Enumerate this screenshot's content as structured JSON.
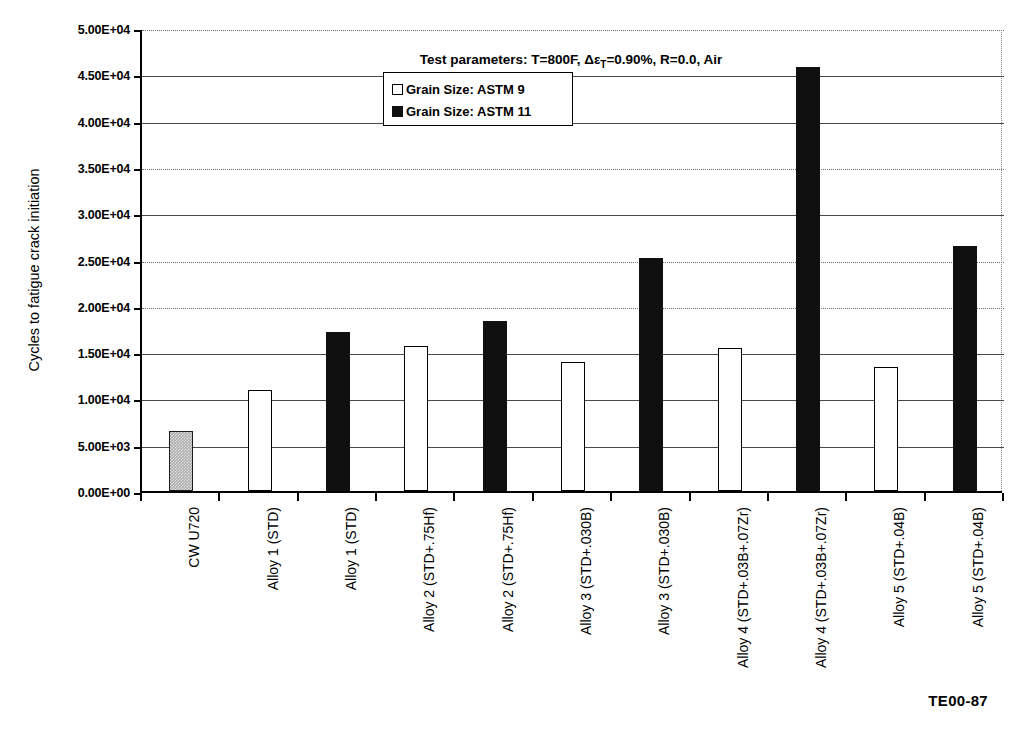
{
  "figure": {
    "footer_code": "TE00-87",
    "title_prefix": "Test parameters: T=800F, ",
    "title_delta": "Δε",
    "title_sub": "T",
    "title_suffix": "=0.90%, R=0.0, Air",
    "title_full": "Test parameters: T=800F, ΔεT=0.90%, R=0.0, Air"
  },
  "legend": {
    "position": "inside-top-center",
    "entries": [
      {
        "label": "Grain Size: ASTM 9",
        "marker": "open-square",
        "color": "#ffffff"
      },
      {
        "label": "Grain Size: ASTM 11",
        "marker": "filled-square",
        "color": "#101010"
      }
    ]
  },
  "axis": {
    "y_title": "Cycles to fatigue crack initiation",
    "y_ticks": [
      "0.00E+00",
      "5.00E+03",
      "1.00E+04",
      "1.50E+04",
      "2.00E+04",
      "2.50E+04",
      "3.00E+04",
      "3.50E+04",
      "4.00E+04",
      "4.50E+04",
      "5.00E+04"
    ],
    "y_tick_values": [
      0,
      5000,
      10000,
      15000,
      20000,
      25000,
      30000,
      35000,
      40000,
      45000,
      50000
    ],
    "x_title": ""
  },
  "chart_data": {
    "type": "bar",
    "title": "Test parameters: T=800F, ΔεT=0.90%, R=0.0, Air",
    "xlabel": "",
    "ylabel": "Cycles to fatigue crack initiation",
    "ylim": [
      0,
      50000
    ],
    "grid": true,
    "legend_position": "inside-top-center",
    "categories": [
      "CW U720",
      "Alloy 1 (STD)",
      "Alloy 1 (STD)",
      "Alloy 2 (STD+.75Hf)",
      "Alloy 2 (STD+.75Hf)",
      "Alloy 3 (STD+.030B)",
      "Alloy 3 (STD+.030B)",
      "Alloy 4 (STD+.03B+.07Zr)",
      "Alloy 4 (STD+.03B+.07Zr)",
      "Alloy 5 (STD+.04B)",
      "Alloy 5 (STD+.04B)"
    ],
    "series_of_bar": [
      "CW U720",
      "Grain Size: ASTM 9",
      "Grain Size: ASTM 11",
      "Grain Size: ASTM 9",
      "Grain Size: ASTM 11",
      "Grain Size: ASTM 9",
      "Grain Size: ASTM 11",
      "Grain Size: ASTM 9",
      "Grain Size: ASTM 11",
      "Grain Size: ASTM 9",
      "Grain Size: ASTM 11"
    ],
    "values": [
      6500,
      10900,
      17200,
      15700,
      18400,
      13900,
      25200,
      15400,
      45800,
      13400,
      26500
    ],
    "series": [
      {
        "name": "Grain Size: ASTM 9",
        "values": [
          null,
          10900,
          null,
          15700,
          null,
          13900,
          null,
          15400,
          null,
          13400,
          null
        ]
      },
      {
        "name": "Grain Size: ASTM 11",
        "values": [
          null,
          null,
          17200,
          null,
          18400,
          null,
          25200,
          null,
          45800,
          null,
          26500
        ]
      },
      {
        "name": "CW U720 (baseline)",
        "values": [
          6500,
          null,
          null,
          null,
          null,
          null,
          null,
          null,
          null,
          null,
          null
        ]
      }
    ]
  },
  "bars": [
    {
      "label": "CW U720",
      "value": 6500,
      "style": "cw"
    },
    {
      "label": "Alloy 1 (STD)",
      "value": 10900,
      "style": "astm9"
    },
    {
      "label": "Alloy 1 (STD)",
      "value": 17200,
      "style": "astm11"
    },
    {
      "label": "Alloy 2 (STD+.75Hf)",
      "value": 15700,
      "style": "astm9"
    },
    {
      "label": "Alloy 2 (STD+.75Hf)",
      "value": 18400,
      "style": "astm11"
    },
    {
      "label": "Alloy 3 (STD+.030B)",
      "value": 13900,
      "style": "astm9"
    },
    {
      "label": "Alloy 3 (STD+.030B)",
      "value": 25200,
      "style": "astm11"
    },
    {
      "label": "Alloy 4 (STD+.03B+.07Zr)",
      "value": 15400,
      "style": "astm9"
    },
    {
      "label": "Alloy 4 (STD+.03B+.07Zr)",
      "value": 45800,
      "style": "astm11"
    },
    {
      "label": "Alloy 5 (STD+.04B)",
      "value": 13400,
      "style": "astm9"
    },
    {
      "label": "Alloy 5 (STD+.04B)",
      "value": 26500,
      "style": "astm11"
    }
  ],
  "colors": {
    "bar_open": "#ffffff",
    "bar_filled": "#101010",
    "bar_hatched": "#a9a9a9",
    "grid": "#4a4a4a",
    "axis": "#000000",
    "background": "#ffffff"
  }
}
